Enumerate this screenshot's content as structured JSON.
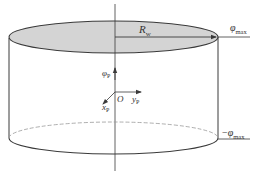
{
  "diagram": {
    "type": "cylinder-coordinate-diagram",
    "colors": {
      "stroke": "#3a3a3a",
      "top_fill": "#d4d4d4",
      "background": "#ffffff",
      "hidden_edge": "#999999"
    },
    "labels": {
      "radius": {
        "main": "R",
        "sub": "w"
      },
      "phi_max_top": {
        "main": "φ",
        "sub": "max"
      },
      "phi_max_bottom": {
        "prefix": "−",
        "main": "φ",
        "sub": "max"
      },
      "phi_p": {
        "main": "φ",
        "sub": "P"
      },
      "origin": "O",
      "y_axis": {
        "main": "y",
        "sub": "P"
      },
      "x_axis": {
        "main": "x",
        "sub": "P"
      }
    }
  }
}
